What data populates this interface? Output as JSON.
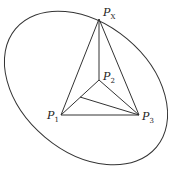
{
  "diagram": {
    "type": "geometry",
    "points": {
      "Px": {
        "label": "P",
        "subscript": "X",
        "x": 99,
        "y": 19
      },
      "P2": {
        "label": "P",
        "subscript": "2",
        "x": 99,
        "y": 80
      },
      "P1": {
        "label": "P",
        "subscript": "1",
        "x": 61,
        "y": 115
      },
      "P3": {
        "label": "P",
        "subscript": "3",
        "x": 139,
        "y": 115
      },
      "inner": {
        "x": 80,
        "y": 97
      }
    },
    "ellipse": {
      "cx": 86,
      "cy": 88,
      "rx": 92,
      "ry": 65,
      "rotation": 40
    },
    "colors": {
      "stroke": "#333333",
      "background": "#ffffff"
    }
  }
}
